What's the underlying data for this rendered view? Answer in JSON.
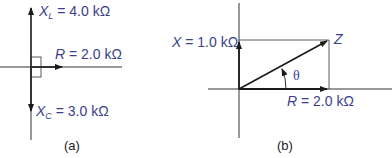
{
  "colors": {
    "label": "#3b3f8c",
    "line": "#1a1a1a"
  },
  "panel_a": {
    "caption": "(a)",
    "xl": {
      "symbol": "X",
      "sub": "L",
      "value": " = 4.0 kΩ"
    },
    "r": {
      "symbol": "R",
      "value": " = 2.0 kΩ"
    },
    "xc": {
      "symbol": "X",
      "sub": "C",
      "value": " = 3.0 kΩ"
    }
  },
  "panel_b": {
    "caption": "(b)",
    "x": {
      "symbol": "X",
      "value": " = 1.0 kΩ"
    },
    "z": {
      "symbol": "Z"
    },
    "theta": "θ",
    "r": {
      "symbol": "R",
      "value": " = 2.0 kΩ"
    }
  }
}
